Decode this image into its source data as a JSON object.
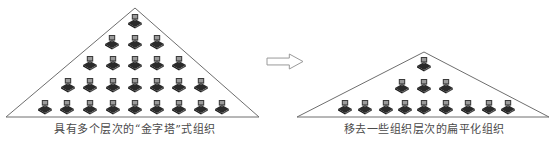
{
  "diagram": {
    "colors": {
      "outline": "#6e6e6e",
      "icon_dark": "#2a2a2a",
      "icon_mid": "#555555",
      "icon_light": "#9a9a9a",
      "caption": "#4a4a4a",
      "arrow": "#9a9a9a"
    },
    "left": {
      "caption": "具有多个层次的“金字塔”式组织",
      "triangle": {
        "apex": [
          135,
          8
        ],
        "base_left": [
          6,
          117
        ],
        "base_right": [
          259,
          117
        ]
      },
      "rows": [
        {
          "y": 22,
          "xs": [
            135
          ]
        },
        {
          "y": 43,
          "xs": [
            112,
            135,
            157
          ]
        },
        {
          "y": 64,
          "xs": [
            90,
            113,
            135,
            157,
            179
          ]
        },
        {
          "y": 86,
          "xs": [
            68,
            90,
            113,
            135,
            157,
            179,
            201
          ]
        },
        {
          "y": 108,
          "xs": [
            45,
            67,
            90,
            113,
            135,
            157,
            179,
            201,
            222
          ]
        }
      ],
      "levels": 5,
      "node_count": 25
    },
    "arrow": {
      "icon": "right-arrow-icon",
      "direction": "right",
      "box": [
        267,
        54,
        36,
        15
      ]
    },
    "right": {
      "caption": "移去一些组织层次的扁平化组织",
      "triangle": {
        "apex": [
          424,
          52
        ],
        "base_left": [
          297,
          117
        ],
        "base_right": [
          549,
          117
        ]
      },
      "rows": [
        {
          "y": 65,
          "xs": [
            424
          ]
        },
        {
          "y": 87,
          "xs": [
            402,
            424,
            446
          ]
        },
        {
          "y": 108,
          "xs": [
            345,
            365,
            386,
            405,
            424,
            446,
            468,
            489,
            508
          ]
        }
      ],
      "levels": 3,
      "node_count": 13
    },
    "node_icon": "computer-icon"
  }
}
